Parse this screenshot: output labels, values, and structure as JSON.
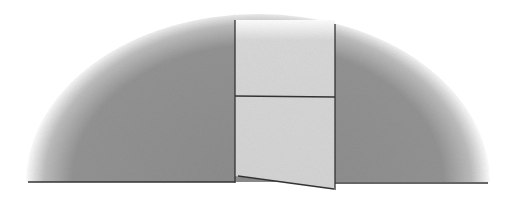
{
  "figure": {
    "colors": {
      "dome_fill": "#8f8f8f",
      "door_fill": "#d6d6d6",
      "outline": "#333333",
      "background": "#ffffff"
    },
    "dome": {
      "cx": 258,
      "base_y": 182,
      "rx": 232,
      "ry": 168
    },
    "door": {
      "left": 235,
      "right": 335,
      "top": 20,
      "divider_y": 96,
      "bottom_left_y": 176,
      "bottom_right_y": 189
    },
    "labels": []
  }
}
